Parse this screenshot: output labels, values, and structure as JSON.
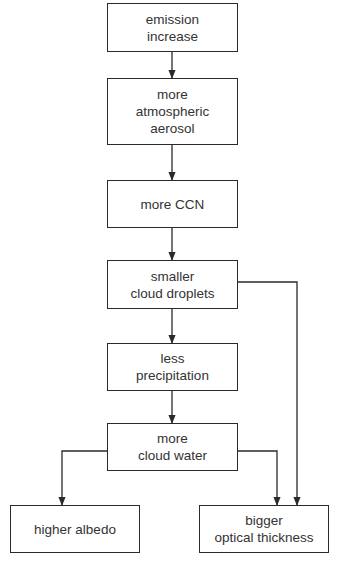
{
  "diagram": {
    "type": "flowchart",
    "colors": {
      "line": "#2a2a2a",
      "text": "#333333",
      "background": "#ffffff"
    },
    "nodes": [
      {
        "id": "n1",
        "label": "emission\nincrease",
        "x": 107,
        "y": 3,
        "w": 131,
        "h": 49
      },
      {
        "id": "n2",
        "label": "more\natmospheric\naerosol",
        "x": 107,
        "y": 78,
        "w": 131,
        "h": 67
      },
      {
        "id": "n3",
        "label": "more CCN",
        "x": 107,
        "y": 180,
        "w": 131,
        "h": 48
      },
      {
        "id": "n4",
        "label": "smaller\ncloud droplets",
        "x": 107,
        "y": 260,
        "w": 131,
        "h": 49
      },
      {
        "id": "n5",
        "label": "less\nprecipitation",
        "x": 107,
        "y": 343,
        "w": 131,
        "h": 48
      },
      {
        "id": "n6",
        "label": "more\ncloud water",
        "x": 107,
        "y": 423,
        "w": 131,
        "h": 48
      },
      {
        "id": "n7",
        "label": "higher albedo",
        "x": 10,
        "y": 505,
        "w": 130,
        "h": 48
      },
      {
        "id": "n8",
        "label": "bigger\noptical thickness",
        "x": 199,
        "y": 505,
        "w": 130,
        "h": 48
      }
    ],
    "edges": [
      {
        "from": "n1",
        "to": "n2",
        "points": [
          [
            172,
            52
          ],
          [
            172,
            78
          ]
        ]
      },
      {
        "from": "n2",
        "to": "n3",
        "points": [
          [
            172,
            145
          ],
          [
            172,
            180
          ]
        ]
      },
      {
        "from": "n3",
        "to": "n4",
        "points": [
          [
            172,
            228
          ],
          [
            172,
            260
          ]
        ]
      },
      {
        "from": "n4",
        "to": "n5",
        "points": [
          [
            172,
            309
          ],
          [
            172,
            343
          ]
        ]
      },
      {
        "from": "n5",
        "to": "n6",
        "points": [
          [
            172,
            391
          ],
          [
            172,
            423
          ]
        ]
      },
      {
        "from": "n6",
        "to": "n7",
        "points": [
          [
            107,
            451
          ],
          [
            62,
            451
          ],
          [
            62,
            505
          ]
        ]
      },
      {
        "from": "n6",
        "to": "n8",
        "points": [
          [
            238,
            451
          ],
          [
            277,
            451
          ],
          [
            277,
            505
          ]
        ]
      },
      {
        "from": "n4",
        "to": "n8",
        "points": [
          [
            238,
            282
          ],
          [
            297,
            282
          ],
          [
            297,
            505
          ]
        ]
      }
    ]
  }
}
